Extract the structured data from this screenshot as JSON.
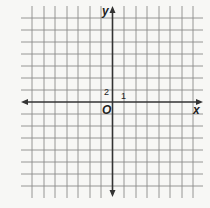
{
  "diagram": {
    "type": "coordinate-plane",
    "grid": {
      "vertical_lines_x": [
        32,
        44,
        55,
        67,
        78,
        90,
        101,
        124,
        136,
        147,
        159,
        170,
        182,
        193
      ],
      "horizontal_lines_y": [
        18,
        30,
        42,
        54,
        66,
        78,
        90,
        114,
        126,
        138,
        150,
        162,
        174,
        186
      ],
      "x_extent": [
        21,
        203
      ],
      "y_extent": [
        6,
        198
      ],
      "line_color": "#8a8a8a"
    },
    "axes": {
      "origin": [
        112.5,
        102
      ],
      "x_axis_label": "x",
      "y_axis_label": "y",
      "origin_label": "O",
      "axis_color": "#333333"
    },
    "scale_labels": {
      "x_tick_label": "1",
      "y_tick_label": "2"
    }
  }
}
